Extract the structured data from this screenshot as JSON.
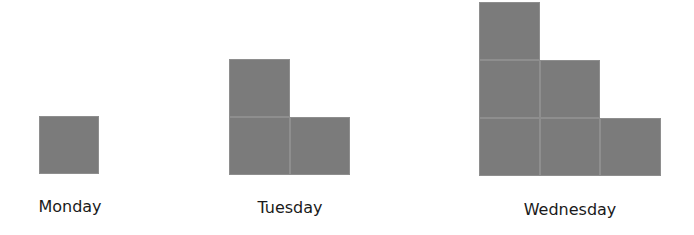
{
  "chart_data": {
    "type": "bar",
    "subtype": "staircase-unit-blocks",
    "title": "",
    "xlabel": "",
    "ylabel": "",
    "categories": [
      "Monday",
      "Tuesday",
      "Wednesday"
    ],
    "values": [
      1,
      3,
      6
    ],
    "layouts": [
      {
        "day": "Monday",
        "columns": [
          1
        ]
      },
      {
        "day": "Tuesday",
        "columns": [
          2,
          1
        ]
      },
      {
        "day": "Wednesday",
        "columns": [
          3,
          2,
          1
        ]
      }
    ],
    "grid": false,
    "legend": null,
    "block_color": "#7b7b7b"
  },
  "labels": {
    "monday": "Monday",
    "tuesday": "Tuesday",
    "wednesday": "Wednesday"
  }
}
